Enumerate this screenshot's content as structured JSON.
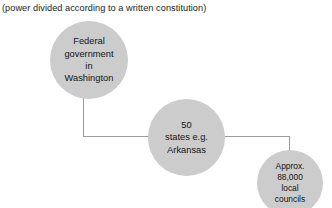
{
  "diagram": {
    "caption": "(power divided according to a written constitution)",
    "type": "hierarchy-tree",
    "background_color": "#ffffff",
    "node_fill_color": "#cccccc",
    "connector_color": "#9c9c9c",
    "text_color": "#141414",
    "nodes": [
      {
        "id": "federal",
        "label": "Federal\ngovernment\nin\nWashington",
        "level": 1
      },
      {
        "id": "states",
        "label": "50\nstates e.g.\nArkansas",
        "level": 2
      },
      {
        "id": "councils",
        "label": "Approx.\n88,000\nlocal\ncouncils",
        "level": 3
      }
    ],
    "edges": [
      {
        "from": "federal",
        "to": "states"
      },
      {
        "from": "states",
        "to": "councils"
      }
    ]
  }
}
